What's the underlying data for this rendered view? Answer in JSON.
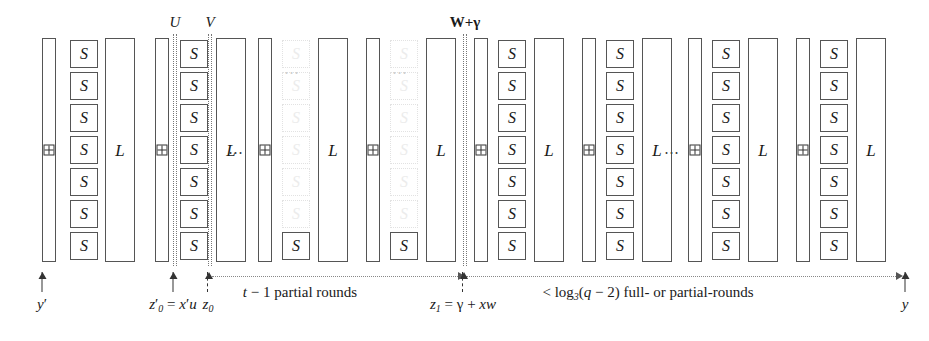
{
  "diagram": {
    "glyphs": {
      "sbox": "S",
      "linear": "L",
      "add": "add-round-constant"
    },
    "vertical_markers": [
      {
        "id": "U",
        "label": "U",
        "x": 173,
        "bold": false
      },
      {
        "id": "V",
        "label": "V",
        "x": 208,
        "bold": false
      },
      {
        "id": "Wgamma",
        "label": "W+γ",
        "x": 463,
        "bold": true
      }
    ],
    "bottom_arrows": [
      {
        "id": "yprime",
        "label": "y′",
        "x": 42,
        "dashed": false
      },
      {
        "id": "z0prime",
        "label": "z′0 = x′u",
        "x": 173,
        "dashed": false
      },
      {
        "id": "z0",
        "label": "z0",
        "x": 208,
        "dashed": true
      },
      {
        "id": "z1",
        "label": "z1 = γ + xw",
        "x": 463,
        "dashed": true
      },
      {
        "id": "y",
        "label": "y",
        "x": 905,
        "dashed": false
      }
    ],
    "spans": [
      {
        "id": "partial-rounds",
        "label": "t − 1 partial rounds",
        "x1": 212,
        "x2": 462,
        "label_x": 300
      },
      {
        "id": "full-rounds",
        "label": "< log3(q − 2) full- or partial-rounds",
        "x1": 466,
        "x2": 900,
        "label_x": 648
      }
    ],
    "groups": [
      {
        "id": "g0",
        "kind": "full",
        "add_x": 42,
        "sbox_x": 70,
        "l_x": 105,
        "has_add": true,
        "has_sbox": true,
        "has_l": true,
        "dots_after": false
      },
      {
        "id": "g1",
        "kind": "full",
        "add_x": 155,
        "sbox_x": 180,
        "l_x": 216,
        "has_add": true,
        "has_sbox": true,
        "has_l": true,
        "dots_after": true
      },
      {
        "id": "g2",
        "kind": "partial",
        "add_x": 258,
        "sbox_x": 282,
        "l_x": 318,
        "has_add": true,
        "has_sbox": true,
        "has_l": true,
        "dots_after": false
      },
      {
        "id": "g3",
        "kind": "partial",
        "add_x": 366,
        "sbox_x": 390,
        "l_x": 426,
        "has_add": true,
        "has_sbox": true,
        "has_l": true,
        "dots_after": false
      },
      {
        "id": "g4",
        "kind": "full",
        "add_x": 474,
        "sbox_x": 498,
        "l_x": 534,
        "has_add": true,
        "has_sbox": true,
        "has_l": true,
        "dots_after": false
      },
      {
        "id": "g5",
        "kind": "full",
        "add_x": 582,
        "sbox_x": 606,
        "l_x": 642,
        "has_add": true,
        "has_sbox": true,
        "has_l": true,
        "dots_after": true
      },
      {
        "id": "g6",
        "kind": "full",
        "add_x": 688,
        "sbox_x": 712,
        "l_x": 748,
        "has_add": true,
        "has_sbox": true,
        "has_l": true,
        "dots_after": false
      },
      {
        "id": "g7",
        "kind": "full",
        "add_x": 796,
        "sbox_x": 820,
        "l_x": 856,
        "has_add": true,
        "has_sbox": true,
        "has_l": true,
        "dots_after": false
      }
    ],
    "sbox_rows": 7,
    "sbox_row_tops": [
      40,
      72,
      104,
      136,
      168,
      200,
      232
    ],
    "partial_solid_row": 6,
    "dots_x": [
      236,
      672
    ],
    "faint_dots": [
      {
        "x": 292,
        "y": 72
      },
      {
        "x": 400,
        "y": 72
      }
    ],
    "colors": {
      "stroke": "#555555",
      "text": "#1a1a1a",
      "ghost": "#ececec",
      "dotted": "#777777"
    }
  }
}
